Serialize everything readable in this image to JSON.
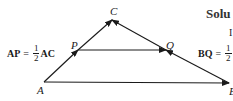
{
  "diagram": {
    "type": "vector-triangle",
    "points": {
      "A": {
        "label": "A",
        "x": 44,
        "y": 82
      },
      "B": {
        "label": "B",
        "x": 229,
        "y": 83
      },
      "C": {
        "label": "C",
        "x": 112,
        "y": 20
      },
      "P": {
        "label": "P",
        "x": 78,
        "y": 50
      },
      "Q": {
        "label": "Q",
        "x": 166,
        "y": 50
      }
    },
    "edges": [
      {
        "from": "A",
        "to": "C",
        "arrow": "C",
        "mid_arrow": "P"
      },
      {
        "from": "B",
        "to": "C",
        "arrow": "C",
        "mid_arrow": "Q"
      },
      {
        "from": "A",
        "to": "B",
        "arrow": "B"
      },
      {
        "from": "P",
        "to": "Q",
        "arrow": "Q"
      }
    ],
    "line_color": "#1a1a1a"
  },
  "equations": {
    "ap": {
      "lhs": "AP",
      "eq": "=",
      "num": "1",
      "den": "2",
      "rhs": "AC"
    },
    "bq": {
      "lhs": "BQ",
      "eq": "=",
      "num": "1",
      "den": "2"
    }
  },
  "side_text": {
    "solution_heading": "Solu",
    "fragment": "I"
  }
}
